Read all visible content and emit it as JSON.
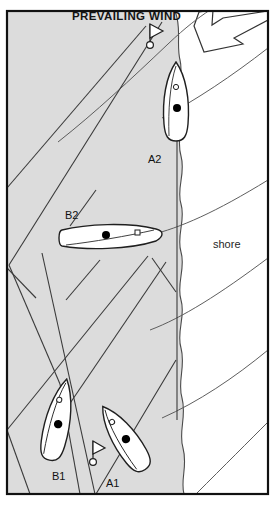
{
  "figure": {
    "type": "sailing-tactics-diagram",
    "title": "PREVAILING WIND",
    "background_color": "#ffffff",
    "water_color": "#dcdcdc",
    "shore_color": "#ffffff",
    "line_color": "#3a3a3a",
    "frame_color": "#111111"
  },
  "labels": {
    "prevailing_wind": "PREVAILING WIND",
    "shore": "shore",
    "boat_a2": "A2",
    "boat_b2": "B2",
    "boat_b1": "B1",
    "boat_a1": "A1"
  },
  "boats": [
    {
      "id": "A2",
      "label": "A2",
      "orientation": "vertical",
      "position": {
        "x": 176,
        "y": 105
      },
      "crew_dot": "filled",
      "bow_marker": "open"
    },
    {
      "id": "B2",
      "label": "B2",
      "orientation": "horizontal",
      "position": {
        "x": 110,
        "y": 238
      },
      "crew_dot": "filled",
      "bow_marker": "open"
    },
    {
      "id": "B1",
      "label": "B1",
      "orientation": "tilted-left",
      "position": {
        "x": 58,
        "y": 420
      },
      "crew_dot": "filled",
      "bow_marker": "open"
    },
    {
      "id": "A1",
      "label": "A1",
      "orientation": "tilted-right",
      "position": {
        "x": 122,
        "y": 438
      },
      "crew_dot": "filled",
      "bow_marker": "open"
    }
  ],
  "markers": [
    {
      "id": "top-buoy",
      "type": "flag-buoy",
      "x": 150,
      "y": 40
    },
    {
      "id": "bottom-buoy",
      "type": "flag-buoy",
      "x": 93,
      "y": 458
    }
  ],
  "wind_arrow": {
    "name": "prevailing-wind-arrow",
    "direction": "up-left"
  }
}
